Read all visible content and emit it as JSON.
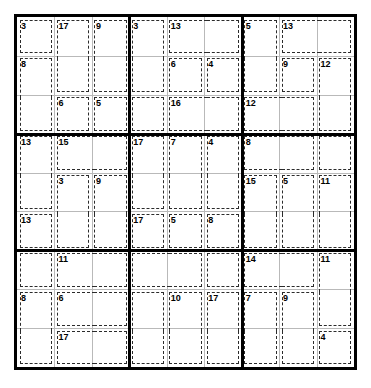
{
  "puzzle": {
    "type": "killer-sudoku",
    "grid_size": 9,
    "box_size": 3,
    "given_digits": [],
    "cage_count": 35,
    "cages": [
      {
        "id": "cage-r1c1",
        "sum": "3",
        "cells": [
          [
            1,
            1
          ]
        ]
      },
      {
        "id": "cage-r1c2",
        "sum": "17",
        "cells": [
          [
            1,
            2
          ],
          [
            2,
            2
          ]
        ]
      },
      {
        "id": "cage-r1c3",
        "sum": "9",
        "cells": [
          [
            1,
            3
          ],
          [
            2,
            3
          ]
        ]
      },
      {
        "id": "cage-r2c1",
        "sum": "8",
        "cells": [
          [
            2,
            1
          ],
          [
            3,
            1
          ]
        ]
      },
      {
        "id": "cage-r3c2",
        "sum": "6",
        "cells": [
          [
            3,
            2
          ]
        ]
      },
      {
        "id": "cage-r3c3",
        "sum": "5",
        "cells": [
          [
            3,
            3
          ]
        ]
      },
      {
        "id": "cage-r1c4",
        "sum": "3",
        "cells": [
          [
            1,
            4
          ],
          [
            2,
            4
          ]
        ]
      },
      {
        "id": "cage-r1c5",
        "sum": "13",
        "cells": [
          [
            1,
            5
          ],
          [
            1,
            6
          ]
        ]
      },
      {
        "id": "cage-r2c5",
        "sum": "6",
        "cells": [
          [
            2,
            5
          ]
        ]
      },
      {
        "id": "cage-r2c6",
        "sum": "4",
        "cells": [
          [
            2,
            6
          ]
        ]
      },
      {
        "id": "cage-r3c4",
        "sum": "",
        "cells": [
          [
            3,
            4
          ]
        ]
      },
      {
        "id": "cage-r3c5",
        "sum": "16",
        "cells": [
          [
            3,
            5
          ],
          [
            3,
            6
          ]
        ]
      },
      {
        "id": "cage-r1c7",
        "sum": "5",
        "cells": [
          [
            1,
            7
          ],
          [
            2,
            7
          ]
        ]
      },
      {
        "id": "cage-r1c8",
        "sum": "13",
        "cells": [
          [
            1,
            8
          ],
          [
            1,
            9
          ]
        ]
      },
      {
        "id": "cage-r2c8",
        "sum": "9",
        "cells": [
          [
            2,
            8
          ]
        ]
      },
      {
        "id": "cage-r2c9",
        "sum": "12",
        "cells": [
          [
            2,
            9
          ],
          [
            3,
            9
          ]
        ]
      },
      {
        "id": "cage-r3c7",
        "sum": "12",
        "cells": [
          [
            3,
            7
          ],
          [
            3,
            8
          ]
        ]
      },
      {
        "id": "cage-r4c1",
        "sum": "13",
        "cells": [
          [
            4,
            1
          ],
          [
            5,
            1
          ]
        ]
      },
      {
        "id": "cage-r4c2",
        "sum": "15",
        "cells": [
          [
            4,
            2
          ],
          [
            4,
            3
          ]
        ]
      },
      {
        "id": "cage-r5c2",
        "sum": "3",
        "cells": [
          [
            5,
            2
          ],
          [
            6,
            2
          ]
        ]
      },
      {
        "id": "cage-r5c3",
        "sum": "9",
        "cells": [
          [
            5,
            3
          ],
          [
            6,
            3
          ]
        ]
      },
      {
        "id": "cage-r6c1",
        "sum": "13",
        "cells": [
          [
            6,
            1
          ]
        ]
      },
      {
        "id": "cage-r4c4",
        "sum": "17",
        "cells": [
          [
            4,
            4
          ],
          [
            5,
            4
          ]
        ]
      },
      {
        "id": "cage-r4c5",
        "sum": "7",
        "cells": [
          [
            4,
            5
          ],
          [
            5,
            5
          ]
        ]
      },
      {
        "id": "cage-r4c6",
        "sum": "4",
        "cells": [
          [
            4,
            6
          ],
          [
            5,
            6
          ]
        ]
      },
      {
        "id": "cage-r6c4",
        "sum": "17",
        "cells": [
          [
            6,
            4
          ]
        ]
      },
      {
        "id": "cage-r6c5",
        "sum": "5",
        "cells": [
          [
            6,
            5
          ]
        ]
      },
      {
        "id": "cage-r6c6",
        "sum": "8",
        "cells": [
          [
            6,
            6
          ]
        ]
      },
      {
        "id": "cage-r4c7",
        "sum": "8",
        "cells": [
          [
            4,
            7
          ],
          [
            4,
            8
          ]
        ]
      },
      {
        "id": "cage-r4c9",
        "sum": "",
        "cells": [
          [
            4,
            9
          ]
        ]
      },
      {
        "id": "cage-r5c7",
        "sum": "15",
        "cells": [
          [
            5,
            7
          ],
          [
            6,
            7
          ]
        ]
      },
      {
        "id": "cage-r5c8",
        "sum": "5",
        "cells": [
          [
            5,
            8
          ],
          [
            6,
            8
          ]
        ]
      },
      {
        "id": "cage-r5c9",
        "sum": "11",
        "cells": [
          [
            5,
            9
          ],
          [
            6,
            9
          ]
        ]
      },
      {
        "id": "cage-r7c1",
        "sum": "",
        "cells": [
          [
            7,
            1
          ]
        ]
      },
      {
        "id": "cage-r7c2",
        "sum": "11",
        "cells": [
          [
            7,
            2
          ],
          [
            7,
            3
          ]
        ]
      },
      {
        "id": "cage-r8c1",
        "sum": "8",
        "cells": [
          [
            8,
            1
          ],
          [
            9,
            1
          ]
        ]
      },
      {
        "id": "cage-r8c2",
        "sum": "6",
        "cells": [
          [
            8,
            2
          ],
          [
            8,
            3
          ]
        ]
      },
      {
        "id": "cage-r9c2",
        "sum": "17",
        "cells": [
          [
            9,
            2
          ],
          [
            9,
            3
          ]
        ]
      },
      {
        "id": "cage-r7c4",
        "sum": "",
        "cells": [
          [
            7,
            4
          ],
          [
            7,
            5
          ]
        ]
      },
      {
        "id": "cage-r7c6",
        "sum": "",
        "cells": [
          [
            7,
            6
          ]
        ]
      },
      {
        "id": "cage-r8c5",
        "sum": "10",
        "cells": [
          [
            8,
            5
          ],
          [
            9,
            5
          ]
        ]
      },
      {
        "id": "cage-r8c6",
        "sum": "17",
        "cells": [
          [
            8,
            6
          ],
          [
            9,
            6
          ]
        ]
      },
      {
        "id": "cage-r8c4",
        "sum": "",
        "cells": [
          [
            8,
            4
          ],
          [
            9,
            4
          ]
        ]
      },
      {
        "id": "cage-r7c7",
        "sum": "14",
        "cells": [
          [
            7,
            7
          ],
          [
            7,
            8
          ]
        ]
      },
      {
        "id": "cage-r7c9",
        "sum": "11",
        "cells": [
          [
            7,
            9
          ],
          [
            8,
            9
          ]
        ]
      },
      {
        "id": "cage-r8c7",
        "sum": "7",
        "cells": [
          [
            8,
            7
          ],
          [
            9,
            7
          ]
        ]
      },
      {
        "id": "cage-r8c8",
        "sum": "9",
        "cells": [
          [
            8,
            8
          ],
          [
            9,
            8
          ]
        ]
      },
      {
        "id": "cage-r9c9",
        "sum": "4",
        "cells": [
          [
            9,
            9
          ]
        ]
      }
    ],
    "cage_sum_labels": [
      {
        "name": "cage-sum-r1c1",
        "text": "3",
        "row": 1,
        "col": 1
      },
      {
        "name": "cage-sum-r1c2",
        "text": "17",
        "row": 1,
        "col": 2
      },
      {
        "name": "cage-sum-r1c3",
        "text": "9",
        "row": 1,
        "col": 3
      },
      {
        "name": "cage-sum-r1c4",
        "text": "3",
        "row": 1,
        "col": 4
      },
      {
        "name": "cage-sum-r1c5",
        "text": "13",
        "row": 1,
        "col": 5
      },
      {
        "name": "cage-sum-r1c7",
        "text": "5",
        "row": 1,
        "col": 7
      },
      {
        "name": "cage-sum-r1c8",
        "text": "13",
        "row": 1,
        "col": 8
      },
      {
        "name": "cage-sum-r2c1",
        "text": "8",
        "row": 2,
        "col": 1
      },
      {
        "name": "cage-sum-r2c5",
        "text": "6",
        "row": 2,
        "col": 5
      },
      {
        "name": "cage-sum-r2c6",
        "text": "4",
        "row": 2,
        "col": 6
      },
      {
        "name": "cage-sum-r2c8",
        "text": "9",
        "row": 2,
        "col": 8
      },
      {
        "name": "cage-sum-r2c9",
        "text": "12",
        "row": 2,
        "col": 9
      },
      {
        "name": "cage-sum-r3c2",
        "text": "6",
        "row": 3,
        "col": 2
      },
      {
        "name": "cage-sum-r3c3",
        "text": "5",
        "row": 3,
        "col": 3
      },
      {
        "name": "cage-sum-r3c5",
        "text": "16",
        "row": 3,
        "col": 5
      },
      {
        "name": "cage-sum-r3c7",
        "text": "12",
        "row": 3,
        "col": 7
      },
      {
        "name": "cage-sum-r4c1",
        "text": "13",
        "row": 4,
        "col": 1
      },
      {
        "name": "cage-sum-r4c2",
        "text": "15",
        "row": 4,
        "col": 2
      },
      {
        "name": "cage-sum-r4c4",
        "text": "17",
        "row": 4,
        "col": 4
      },
      {
        "name": "cage-sum-r4c5",
        "text": "7",
        "row": 4,
        "col": 5
      },
      {
        "name": "cage-sum-r4c6",
        "text": "4",
        "row": 4,
        "col": 6
      },
      {
        "name": "cage-sum-r4c7",
        "text": "8",
        "row": 4,
        "col": 7
      },
      {
        "name": "cage-sum-r5c2",
        "text": "3",
        "row": 5,
        "col": 2
      },
      {
        "name": "cage-sum-r5c3",
        "text": "9",
        "row": 5,
        "col": 3
      },
      {
        "name": "cage-sum-r5c7",
        "text": "15",
        "row": 5,
        "col": 7
      },
      {
        "name": "cage-sum-r5c8",
        "text": "5",
        "row": 5,
        "col": 8
      },
      {
        "name": "cage-sum-r5c9",
        "text": "11",
        "row": 5,
        "col": 9
      },
      {
        "name": "cage-sum-r6c1",
        "text": "13",
        "row": 6,
        "col": 1
      },
      {
        "name": "cage-sum-r6c4",
        "text": "17",
        "row": 6,
        "col": 4
      },
      {
        "name": "cage-sum-r6c5",
        "text": "5",
        "row": 6,
        "col": 5
      },
      {
        "name": "cage-sum-r6c6",
        "text": "8",
        "row": 6,
        "col": 6
      },
      {
        "name": "cage-sum-r7c2",
        "text": "11",
        "row": 7,
        "col": 2
      },
      {
        "name": "cage-sum-r7c7",
        "text": "14",
        "row": 7,
        "col": 7
      },
      {
        "name": "cage-sum-r7c9",
        "text": "11",
        "row": 7,
        "col": 9
      },
      {
        "name": "cage-sum-r8c1",
        "text": "8",
        "row": 8,
        "col": 1
      },
      {
        "name": "cage-sum-r8c2",
        "text": "6",
        "row": 8,
        "col": 2
      },
      {
        "name": "cage-sum-r8c5",
        "text": "10",
        "row": 8,
        "col": 5
      },
      {
        "name": "cage-sum-r8c6",
        "text": "17",
        "row": 8,
        "col": 6
      },
      {
        "name": "cage-sum-r8c7",
        "text": "7",
        "row": 8,
        "col": 7
      },
      {
        "name": "cage-sum-r8c8",
        "text": "9",
        "row": 8,
        "col": 8
      },
      {
        "name": "cage-sum-r9c2",
        "text": "17",
        "row": 9,
        "col": 2
      },
      {
        "name": "cage-sum-r9c9",
        "text": "4",
        "row": 9,
        "col": 9
      }
    ],
    "colors": {
      "background": "#ffffff",
      "grid_line": "#b9b9b9",
      "box_line": "#000000",
      "cage_line": "#2b2b2b",
      "text": "#000000"
    }
  }
}
